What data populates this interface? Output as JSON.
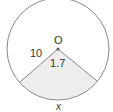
{
  "diagram": {
    "type": "circle-sector",
    "center_label": "O",
    "radius_label": "10",
    "angle_label": "1.7",
    "arc_label": "x",
    "colors": {
      "stroke": "#888888",
      "sector_fill": "#ededed",
      "text": "#333333"
    }
  }
}
